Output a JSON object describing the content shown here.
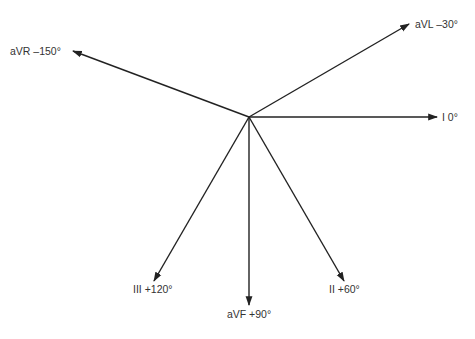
{
  "diagram": {
    "origin": {
      "x": 249,
      "y": 117
    },
    "line_color": "#222222",
    "label_color": "#333333",
    "leads": [
      {
        "id": "aVR",
        "label": "aVR –150°",
        "angle_deg": -150,
        "tip": {
          "x": 73,
          "y": 51
        },
        "label_pos": {
          "x": 10,
          "y": 55,
          "anchor": "start"
        }
      },
      {
        "id": "aVL",
        "label": "aVL –30°",
        "angle_deg": -30,
        "tip": {
          "x": 409,
          "y": 24
        },
        "label_pos": {
          "x": 415,
          "y": 28,
          "anchor": "start"
        }
      },
      {
        "id": "I",
        "label": "I 0°",
        "angle_deg": 0,
        "tip": {
          "x": 437,
          "y": 117
        },
        "label_pos": {
          "x": 442,
          "y": 121,
          "anchor": "start"
        }
      },
      {
        "id": "II",
        "label": "II +60°",
        "angle_deg": 60,
        "tip": {
          "x": 344,
          "y": 281
        },
        "label_pos": {
          "x": 329,
          "y": 293,
          "anchor": "start"
        }
      },
      {
        "id": "aVF",
        "label": "aVF +90°",
        "angle_deg": 90,
        "tip": {
          "x": 249,
          "y": 305
        },
        "label_pos": {
          "x": 249,
          "y": 318,
          "anchor": "middle"
        }
      },
      {
        "id": "III",
        "label": "III +120°",
        "angle_deg": 120,
        "tip": {
          "x": 154,
          "y": 281
        },
        "label_pos": {
          "x": 133,
          "y": 293,
          "anchor": "start"
        }
      }
    ]
  }
}
